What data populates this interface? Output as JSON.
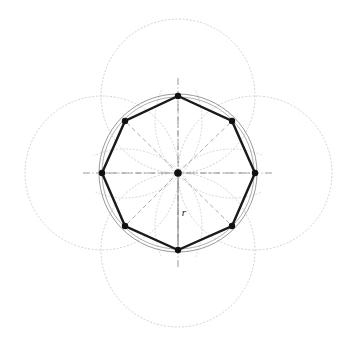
{
  "figure": {
    "background_color": "#ffffff",
    "width": 340,
    "height": 346
  },
  "geometry": {
    "center": {
      "x": 178,
      "y": 173,
      "label": "center-point"
    },
    "circumradius": 77,
    "polygon_sides": 8,
    "vertices": [
      {
        "name": "top",
        "x": 178,
        "y": 96,
        "angle_deg": 90
      },
      {
        "name": "upper-right",
        "x": 232,
        "y": 121,
        "angle_deg": 45
      },
      {
        "name": "right",
        "x": 255,
        "y": 173,
        "angle_deg": 0
      },
      {
        "name": "lower-right",
        "x": 232,
        "y": 226,
        "angle_deg": 315
      },
      {
        "name": "bottom",
        "x": 178,
        "y": 250,
        "angle_deg": 270
      },
      {
        "name": "lower-left",
        "x": 125,
        "y": 226,
        "angle_deg": 225
      },
      {
        "name": "left",
        "x": 102,
        "y": 173,
        "angle_deg": 180
      },
      {
        "name": "upper-left",
        "x": 125,
        "y": 121,
        "angle_deg": 135
      }
    ],
    "construction_circles": [
      {
        "name": "top-arc-circle",
        "cx": 178,
        "cy": 96,
        "r": 77
      },
      {
        "name": "right-arc-circle",
        "cx": 255,
        "cy": 173,
        "r": 77
      },
      {
        "name": "bottom-arc-circle",
        "cx": 178,
        "cy": 250,
        "r": 77
      },
      {
        "name": "left-arc-circle",
        "cx": 102,
        "cy": 173,
        "r": 77
      }
    ],
    "inner_arcs": [
      {
        "name": "inner-arc-upper-left",
        "cx": 125,
        "cy": 121,
        "r": 77
      },
      {
        "name": "inner-arc-upper-right",
        "cx": 232,
        "cy": 121,
        "r": 77
      },
      {
        "name": "inner-arc-lower-left",
        "cx": 125,
        "cy": 226,
        "r": 77
      },
      {
        "name": "inner-arc-lower-right",
        "cx": 232,
        "cy": 226,
        "r": 77
      }
    ]
  },
  "labels": {
    "radius_label": "r",
    "radius_label_x": 184,
    "radius_label_y": 213
  },
  "colors": {
    "polygon_stroke": "#1a1a1a",
    "vertex_fill": "#111111",
    "circumcircle_stroke": "#8c8c8c",
    "dashed_radius_stroke": "#9a9a9a",
    "dotted_construction_stroke": "#c8c8c8",
    "axis_stroke": "#7a7a7a",
    "radius_line_stroke": "#8a8a8a",
    "background": "#ffffff"
  },
  "strokes": {
    "polygon_width": 2.4,
    "circumcircle_width": 0.9,
    "dashed_width": 0.8,
    "dotted_width": 0.8,
    "axis_width": 0.7,
    "vertex_radius": 3.2
  }
}
